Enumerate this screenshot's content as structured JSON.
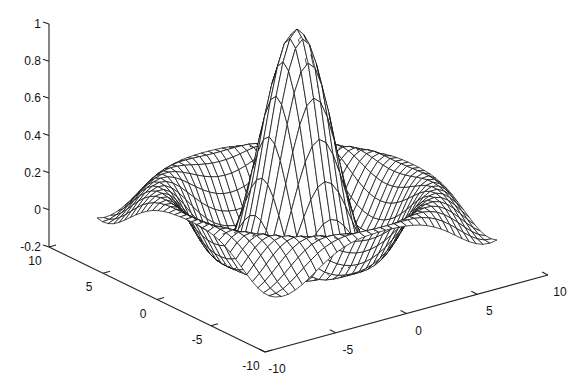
{
  "chart_data": {
    "type": "surface-mesh",
    "title": "",
    "function": "z = sin(r)/r, r = sqrt(x^2 + y^2)",
    "grid": {
      "x_min": -8,
      "x_max": 8,
      "y_min": -8,
      "y_max": 8,
      "step": 0.5,
      "points_per_side": 33
    },
    "z_peak": 1,
    "z_min_approx": -0.217,
    "xlabel": "",
    "ylabel": "",
    "zlabel": "",
    "xlim": [
      -10,
      10
    ],
    "ylim": [
      -10,
      10
    ],
    "zlim": [
      -0.2,
      1
    ],
    "x_ticks": [
      {
        "value": -10,
        "label": "-10"
      },
      {
        "value": -5,
        "label": "-5"
      },
      {
        "value": 0,
        "label": "0"
      },
      {
        "value": 5,
        "label": "5"
      },
      {
        "value": 10,
        "label": "10"
      }
    ],
    "y_ticks": [
      {
        "value": -10,
        "label": "-10"
      },
      {
        "value": -5,
        "label": "-5"
      },
      {
        "value": 0,
        "label": "0"
      },
      {
        "value": 5,
        "label": "5"
      },
      {
        "value": 10,
        "label": "10"
      }
    ],
    "z_ticks": [
      {
        "value": -0.2,
        "label": "-0.2"
      },
      {
        "value": 0,
        "label": "0"
      },
      {
        "value": 0.2,
        "label": "0.2"
      },
      {
        "value": 0.4,
        "label": "0.4"
      },
      {
        "value": 0.6,
        "label": "0.6"
      },
      {
        "value": 0.8,
        "label": "0.8"
      },
      {
        "value": 1,
        "label": "1"
      }
    ],
    "grid_lines": false,
    "legend": null,
    "colors": {
      "mesh_line": "#111111",
      "mesh_fill": "#ffffff",
      "axis": "#222222",
      "background": "#ffffff"
    }
  },
  "projection": {
    "axis_origin_px": [
      265,
      352
    ],
    "axis_x_unit_px": [
      14.15,
      -3.85
    ],
    "axis_y_unit_px": [
      -10.8,
      -5.25
    ],
    "z_axis_x_px": 49,
    "z_axis_top_px": 24,
    "z_axis_bottom_px": 247,
    "surface_center_px": [
      297,
      213.5
    ],
    "surface_x_unit_px": [
      13.9,
      -3.56
    ],
    "surface_y_unit_px": [
      -11.1,
      -4.94
    ],
    "surface_z_unit_px": 184.5
  }
}
